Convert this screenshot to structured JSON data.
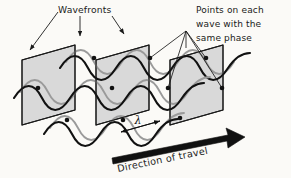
{
  "figure": {
    "background_color": "#fbfaf7"
  },
  "labels": {
    "wavefronts": "Wavefronts",
    "points_line1": "Points on each",
    "points_line2": "wave with the",
    "points_line3": "same phase",
    "wavelength_symbol": "λ",
    "direction": "Direction of travel"
  },
  "colors": {
    "plane_fill": "#d9d9d9",
    "plane_stroke": "#1a1a1a",
    "wave_stroke": "#111111",
    "shadow_wave_stroke": "#9a9a9a",
    "dot_fill": "#111111",
    "leader_stroke": "#1a1a1a",
    "arrow_fill": "#111111",
    "text_color": "#1a1a1a"
  },
  "geometry": {
    "plane_count": 3,
    "wave_row_count": 3,
    "plane_spacing_px": 74,
    "wave_period_px": 74,
    "phase_dot_count": 9
  }
}
